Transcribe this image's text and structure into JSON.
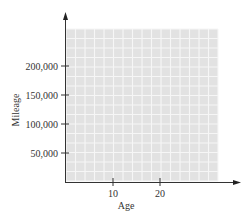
{
  "chart_data": {
    "type": "scatter",
    "title": "",
    "xlabel": "Age",
    "ylabel": "Mileage",
    "x_ticks": [
      10,
      20
    ],
    "x_tick_labels": [
      "10",
      "20"
    ],
    "y_ticks": [
      50000,
      100000,
      150000,
      200000
    ],
    "y_tick_labels": [
      "50,000",
      "100,000",
      "150,000",
      "200,000"
    ],
    "xlim": [
      0,
      32
    ],
    "ylim": [
      0,
      260000
    ],
    "grid": true,
    "grid_color": "#e4e4e4",
    "series": [],
    "legend": null
  }
}
